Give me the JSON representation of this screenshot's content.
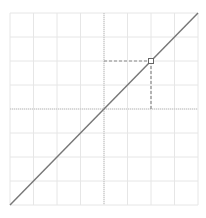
{
  "chart_data": {
    "type": "line",
    "title": "",
    "xlabel": "",
    "ylabel": "",
    "xlim": [
      -4,
      4
    ],
    "ylim": [
      -4,
      4
    ],
    "grid": true,
    "grid_divisions": 8,
    "axes_through_origin": true,
    "series": [
      {
        "name": "y = x",
        "x": [
          -4,
          4
        ],
        "y": [
          -4,
          4
        ],
        "color": "#777777"
      }
    ],
    "highlight_point": {
      "x": 2,
      "y": 2
    },
    "guides": [
      {
        "from": [
          0,
          2
        ],
        "to": [
          2,
          2
        ],
        "style": "dashed"
      },
      {
        "from": [
          2,
          2
        ],
        "to": [
          2,
          0
        ],
        "style": "dashed"
      }
    ]
  },
  "style": {
    "grid_color": "#e6e6e6",
    "axis_color": "#bdbdbd",
    "line_color": "#777777",
    "guide_color": "#888888",
    "point_stroke": "#666666",
    "point_fill": "#ffffff"
  },
  "plot_area": {
    "left": 10,
    "top": 13,
    "right": 198,
    "bottom": 205
  }
}
